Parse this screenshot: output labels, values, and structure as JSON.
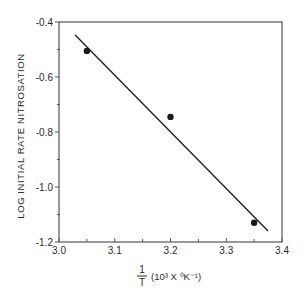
{
  "chart_data": {
    "type": "scatter",
    "title": "",
    "xlabel": "1/T (10^3 X °K^-1)",
    "ylabel": "LOG INITIAL RATE NITROSATION",
    "xlim": [
      3.0,
      3.4
    ],
    "ylim": [
      -1.2,
      -0.4
    ],
    "x_ticks": [
      3.0,
      3.1,
      3.2,
      3.3,
      3.4
    ],
    "x_tick_labels": [
      "3.0",
      "3.1",
      "3.2",
      "3.3",
      "3.4"
    ],
    "x_minor_ticks": [
      3.05,
      3.15,
      3.25,
      3.35
    ],
    "y_ticks": [
      -0.4,
      -0.6,
      -0.8,
      -1.0,
      -1.2
    ],
    "y_tick_labels": [
      "-0.4",
      "-0.6",
      "-0.8",
      "-1.0",
      "-1.2"
    ],
    "y_minor_ticks": [
      -0.5,
      -0.7,
      -0.9,
      -1.1
    ],
    "grid": false,
    "legend": null,
    "series": [
      {
        "name": "measured",
        "marker": "filled-circle",
        "points": [
          {
            "x": 3.05,
            "y": -0.505
          },
          {
            "x": 3.2,
            "y": -0.745
          },
          {
            "x": 3.35,
            "y": -1.13
          }
        ]
      },
      {
        "name": "fit-line",
        "type": "line",
        "points": [
          {
            "x": 3.029,
            "y": -0.447
          },
          {
            "x": 3.375,
            "y": -1.16
          }
        ]
      }
    ]
  },
  "axes": {
    "ylabel": "LOG INITIAL RATE NITROSATION",
    "xlabel_frac_num": "1",
    "xlabel_frac_den": "T",
    "xlabel_unit": "(10³ X ⁰K⁻¹)"
  },
  "colors": {
    "ink": "#1a1a1a",
    "frame": "#555555",
    "background": "#ffffff"
  }
}
